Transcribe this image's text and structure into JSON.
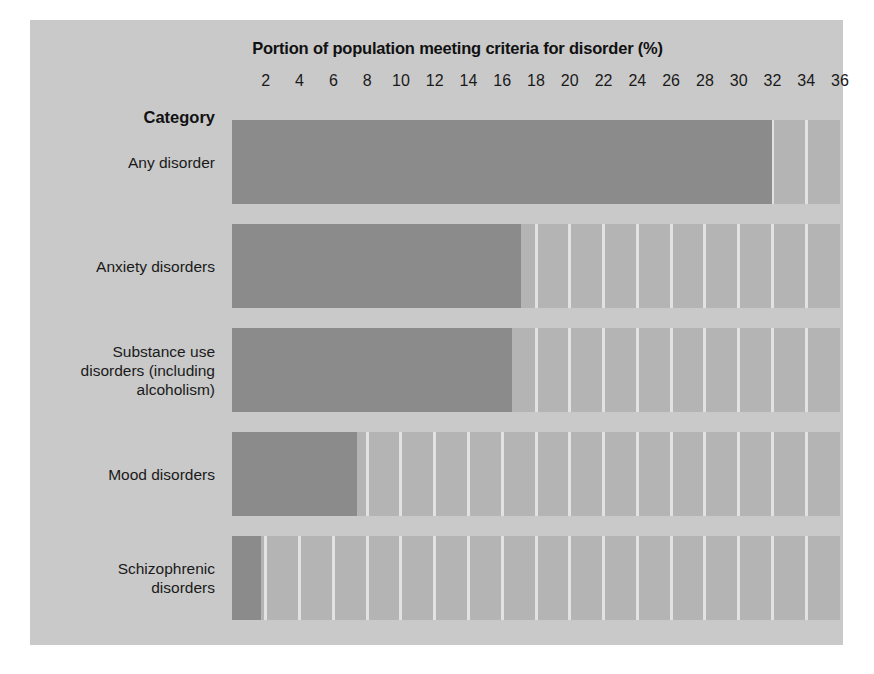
{
  "chart_data": {
    "type": "bar",
    "orientation": "horizontal",
    "title": "Portion of population meeting criteria for disorder (%)",
    "xlabel": "",
    "ylabel": "Category",
    "category_header": "Category",
    "categories": [
      "Any disorder",
      "Anxiety disorders",
      "Substance use disorders (including alcoholism)",
      "Mood disorders",
      "Schizophrenic disorders"
    ],
    "values": [
      32.0,
      17.1,
      16.6,
      7.4,
      1.7
    ],
    "xlim": [
      0,
      36
    ],
    "xticks": [
      2,
      4,
      6,
      8,
      10,
      12,
      14,
      16,
      18,
      20,
      22,
      24,
      26,
      28,
      30,
      32,
      34,
      36
    ],
    "xtick_labels": [
      "2",
      "4",
      "6",
      "8",
      "10",
      "12",
      "14",
      "16",
      "18",
      "20",
      "22",
      "24",
      "26",
      "28",
      "30",
      "32",
      "34",
      "36"
    ],
    "gridline_interval": 2,
    "grid": true,
    "legend": false,
    "legend_position": "none",
    "colors": {
      "bar": "#8b8b8b",
      "plot_background": "#b4b4b4",
      "gridline": "#e2e2e2",
      "figure_background": "#c9c9c9",
      "page_background": "#ffffff",
      "text": "#1a1a1a"
    }
  }
}
